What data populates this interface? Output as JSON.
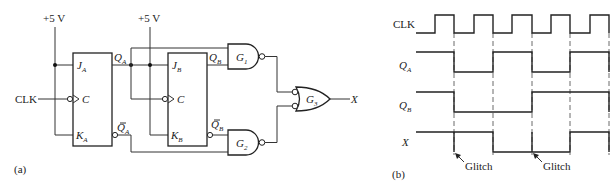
{
  "figure": {
    "panel_a": {
      "label": "(a)",
      "supply_label_1": "+5 V",
      "supply_label_2": "+5 V",
      "clock_input": "CLK",
      "flipflop_a": {
        "j": "J",
        "j_sub": "A",
        "c": "C",
        "k": "K",
        "k_sub": "A",
        "q": "Q",
        "q_sub": "A",
        "qbar": "Q",
        "qbar_sub": "A"
      },
      "flipflop_b": {
        "j": "J",
        "j_sub": "B",
        "c": "C",
        "k": "K",
        "k_sub": "B",
        "q": "Q",
        "q_sub": "B",
        "qbar": "Q",
        "qbar_sub": "B"
      },
      "gates": [
        {
          "name": "G",
          "sub": "1",
          "type": "NAND"
        },
        {
          "name": "G",
          "sub": "2",
          "type": "NAND"
        },
        {
          "name": "G",
          "sub": "3",
          "type": "OR with inverted inputs"
        }
      ],
      "output": "X"
    },
    "panel_b": {
      "label": "(b)",
      "signals": [
        {
          "name": "CLK",
          "sub": ""
        },
        {
          "name": "Q",
          "sub": "A"
        },
        {
          "name": "Q",
          "sub": "B"
        },
        {
          "name": "X",
          "sub": ""
        }
      ],
      "annotations": [
        "Glitch",
        "Glitch"
      ]
    }
  },
  "timing_data": {
    "clock_periods_shown": 5,
    "QA": [
      1,
      0,
      1,
      0,
      1
    ],
    "QB": [
      1,
      0,
      0,
      1,
      1
    ],
    "X": [
      1,
      1,
      0,
      0,
      1
    ],
    "glitches_at_edges": [
      1,
      3
    ]
  }
}
